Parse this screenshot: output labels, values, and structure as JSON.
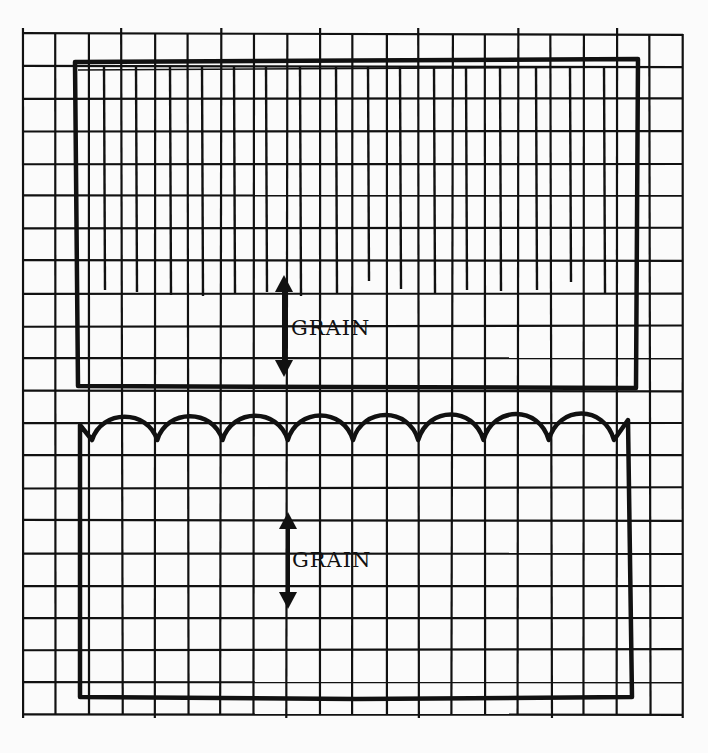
{
  "diagram": {
    "colors": {
      "ink": "#111111",
      "paper": "#fbfbfb"
    },
    "grid": {
      "left": 23,
      "right": 683,
      "top": 34,
      "bottom": 715,
      "cols": 20,
      "rows": 21
    },
    "pieces": [
      {
        "name": "fringed-rectangle",
        "shape": "rectangle with vertical fringe threads",
        "bounds": {
          "x1": 75,
          "y1": 62,
          "x2": 638,
          "y2": 388
        },
        "grain_label": "GRAIN",
        "arrow": {
          "x": 284,
          "y1": 275,
          "y2": 377
        }
      },
      {
        "name": "scalloped-rectangle",
        "shape": "rectangle with scalloped top edge",
        "scallop_count": 8,
        "bounds": {
          "x1": 80,
          "y1": 410,
          "x2": 632,
          "y2": 697
        },
        "grain_label": "GRAIN",
        "arrow": {
          "x": 288,
          "y1": 512,
          "y2": 609
        }
      }
    ]
  }
}
